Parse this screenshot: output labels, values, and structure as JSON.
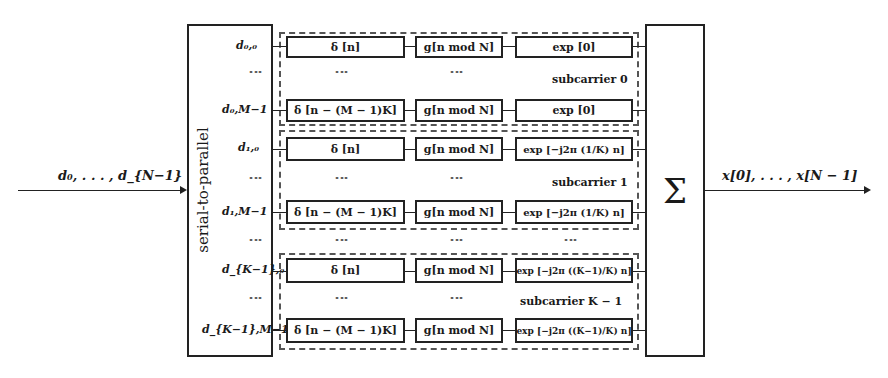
{
  "diagram": {
    "input_label": "d_0, …, d_{N−1}",
    "input_display": "d₀, . . . , d_{N−1}",
    "output_display": "x[0], . . . , x[N − 1]",
    "serial_to_parallel_label": "serial-to-parallel",
    "sum_symbol": "Σ",
    "subcarriers": [
      {
        "label": "subcarrier 0",
        "rows": [
          {
            "input": "d₀,₀",
            "delta": "δ [n]",
            "g": "g[n mod N]",
            "exp": "exp [0]"
          },
          {
            "input": "d₀,M−1",
            "delta": "δ [n − (M − 1)K]",
            "g": "g[n mod N]",
            "exp": "exp [0]"
          }
        ]
      },
      {
        "label": "subcarrier 1",
        "rows": [
          {
            "input": "d₁,₀",
            "delta": "δ [n]",
            "g": "g[n mod N]",
            "exp": "exp [−j2π (1/K) n]"
          },
          {
            "input": "d₁,M−1",
            "delta": "δ [n − (M − 1)K]",
            "g": "g[n mod N]",
            "exp": "exp [−j2π (1/K) n]"
          }
        ]
      },
      {
        "label": "subcarrier K − 1",
        "rows": [
          {
            "input": "d_{K−1},₀",
            "delta": "δ [n]",
            "g": "g[n mod N]",
            "exp": "exp [−j2π ((K−1)/K) n]"
          },
          {
            "input": "d_{K−1},M−1",
            "delta": "δ [n − (M − 1)K]",
            "g": "g[n mod N]",
            "exp": "exp [−j2π ((K−1)/K) n]"
          }
        ]
      }
    ],
    "ellipsis": "⋮"
  }
}
